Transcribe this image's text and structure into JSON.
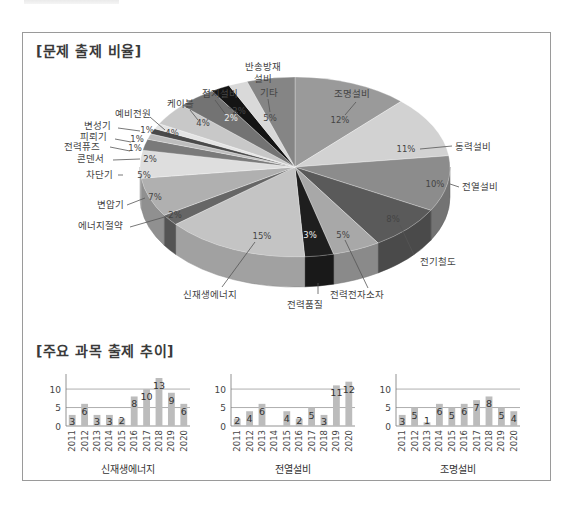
{
  "page": {
    "section1_title": "[문제 출제 비율]",
    "section2_title": "[주요 과목 출제 추이]"
  },
  "chart_data": [
    {
      "type": "pie",
      "title": "[문제 출제 비율]",
      "style": "3d-exploded-tilted",
      "slices": [
        {
          "label": "조명설비",
          "value": 12,
          "color": "#9a9a9a"
        },
        {
          "label": "동력설비",
          "value": 11,
          "color": "#d2d2d2"
        },
        {
          "label": "전열설비",
          "value": 10,
          "color": "#8c8c8c"
        },
        {
          "label": "전기철도",
          "value": 8,
          "color": "#5a5a5a"
        },
        {
          "label": "전력전자소자",
          "value": 5,
          "color": "#a8a8a8"
        },
        {
          "label": "전력품질",
          "value": 3,
          "color": "#1e1e1e"
        },
        {
          "label": "신재생에너지",
          "value": 15,
          "color": "#c4c4c4"
        },
        {
          "label": "에너지절약",
          "value": 2,
          "color": "#666666"
        },
        {
          "label": "변압기",
          "value": 7,
          "color": "#b0b0b0"
        },
        {
          "label": "차단기",
          "value": 5,
          "color": "#dedede"
        },
        {
          "label": "콘덴서",
          "value": 2,
          "color": "#7a7a7a"
        },
        {
          "label": "전력퓨즈",
          "value": 1,
          "color": "#bdbdbd"
        },
        {
          "label": "피뢰기",
          "value": 1,
          "color": "#4a4a4a"
        },
        {
          "label": "변성기",
          "value": 1,
          "color": "#e4e4e4"
        },
        {
          "label": "예비전원",
          "value": 4,
          "color": "#c8c8c8"
        },
        {
          "label": "케이블",
          "value": 4,
          "color": "#737373"
        },
        {
          "label": "접지설비",
          "value": 2,
          "color": "#141414"
        },
        {
          "label": "반송방재설비",
          "value": 2,
          "color": "#d9d9d9"
        },
        {
          "label": "기타",
          "value": 5,
          "color": "#858585"
        }
      ],
      "label_text": {
        "조명설비": {
          "name": "조명설비",
          "pct": "12%"
        },
        "동력설비": {
          "name": "동력설비",
          "pct": "11%"
        },
        "전열설비": {
          "name": "전열설비",
          "pct": "10%"
        },
        "전기철도": {
          "name": "전기철도",
          "pct": "8%"
        },
        "전력전자소자": {
          "name": "전력전자소자",
          "pct": "5%"
        },
        "전력품질": {
          "name": "전력품질",
          "pct": "3%"
        },
        "신재생에너지": {
          "name": "신재생에너지",
          "pct": "15%"
        },
        "에너지절약": {
          "name": "에너지절약",
          "pct": "2%"
        },
        "변압기": {
          "name": "변압기",
          "pct": "7%"
        },
        "차단기": {
          "name": "차단기",
          "pct": "5%"
        },
        "콘덴서": {
          "name": "콘덴서",
          "pct": "2%"
        },
        "전력퓨즈": {
          "name": "전력퓨즈",
          "pct": "1%"
        },
        "피뢰기": {
          "name": "피뢰기",
          "pct": "1%"
        },
        "변성기": {
          "name": "변성기",
          "pct": "1%"
        },
        "예비전원": {
          "name": "예비전원",
          "pct": "4%"
        },
        "케이블": {
          "name": "케이블",
          "pct": "4%"
        },
        "접지설비": {
          "name": "접지설비",
          "pct": "2%"
        },
        "반송방재설비": {
          "name1": "반송방재",
          "name2": "설비",
          "pct": "2%"
        },
        "기타": {
          "name": "기타",
          "pct": "5%"
        }
      }
    },
    {
      "type": "bar",
      "title": "신재생에너지",
      "categories": [
        "2011",
        "2012",
        "2013",
        "2014",
        "2015",
        "2016",
        "2017",
        "2018",
        "2019",
        "2020"
      ],
      "values": [
        3,
        6,
        3,
        3,
        2,
        8,
        10,
        13,
        9,
        6
      ],
      "ylim": [
        0,
        13
      ],
      "yticks": [
        "0",
        "5",
        "10"
      ],
      "grid": true
    },
    {
      "type": "bar",
      "title": "전열설비",
      "categories": [
        "2011",
        "2012",
        "2013",
        "2014",
        "2015",
        "2016",
        "2017",
        "2018",
        "2019",
        "2020"
      ],
      "values": [
        2,
        4,
        6,
        0,
        4,
        2,
        5,
        3,
        11,
        12
      ],
      "value_labels": [
        "2",
        "4",
        "6",
        "",
        "4",
        "2",
        "5",
        "3",
        "11",
        "12"
      ],
      "ylim": [
        0,
        13
      ],
      "yticks": [
        "0",
        "5",
        "10"
      ],
      "grid": true
    },
    {
      "type": "bar",
      "title": "조명설비",
      "categories": [
        "2011",
        "2012",
        "2013",
        "2014",
        "2015",
        "2016",
        "2017",
        "2018",
        "2019",
        "2020"
      ],
      "values": [
        3,
        5,
        1,
        6,
        5,
        6,
        7,
        8,
        5,
        4
      ],
      "ylim": [
        0,
        13
      ],
      "yticks": [
        "0",
        "5",
        "10"
      ],
      "grid": true
    }
  ]
}
